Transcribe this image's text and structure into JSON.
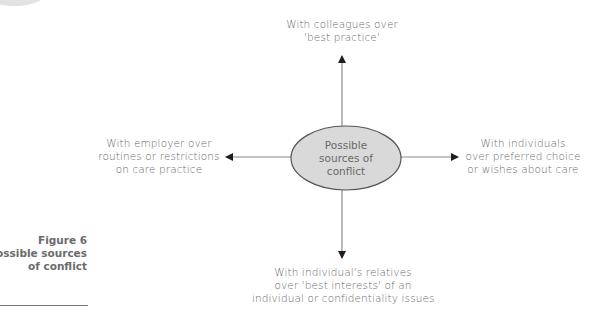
{
  "figure": {
    "number_label": "Figure 6",
    "title_lines": [
      "Possible sources",
      "of conflict"
    ]
  },
  "center_node": {
    "lines": [
      "Possible",
      "sources of",
      "conflict"
    ],
    "fill": "#d9d9d9",
    "stroke": "#555555"
  },
  "branches": {
    "top": {
      "lines": [
        "With colleagues over",
        "'best practice'"
      ]
    },
    "left": {
      "lines": [
        "With employer over",
        "routines or restrictions",
        "on care practice"
      ]
    },
    "right": {
      "lines": [
        "With individuals",
        "over preferred choice",
        "or wishes about care"
      ]
    },
    "bottom": {
      "lines": [
        "With individual's relatives",
        "over 'best interests' of an",
        "individual or confidentiality issues"
      ]
    }
  },
  "colors": {
    "text": "#6a6a6a",
    "arrow": "#222222",
    "line": "#8a8a8a"
  }
}
